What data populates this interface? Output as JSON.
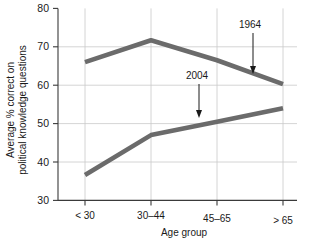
{
  "chart_data": {
    "type": "line",
    "title": "",
    "subtitle": "",
    "xlabel": "Age group",
    "ylabel": "Average % correct on political knowledge questions",
    "ylabel_line1": "Average % correct on",
    "ylabel_line2": "political knowledge questions",
    "categories": [
      "< 30",
      "30–44",
      "45–65",
      "> 65"
    ],
    "ylim": [
      30,
      80
    ],
    "yticks": [
      30,
      40,
      50,
      60,
      70,
      80
    ],
    "ytick_labels": [
      "30",
      "40",
      "50",
      "60",
      "70",
      "80"
    ],
    "grid": true,
    "grid_axis": "y",
    "legend": "none",
    "series": [
      {
        "name": "1964",
        "values": [
          66,
          71.7,
          66.5,
          60.3
        ],
        "color": "#6b6b6b"
      },
      {
        "name": "2004",
        "values": [
          36.6,
          47,
          50.5,
          54
        ],
        "color": "#6b6b6b"
      }
    ],
    "annotations": [
      {
        "label": "1964",
        "series": "1964",
        "target_category": "> 65",
        "label_x": 250,
        "label_y": 28,
        "arrow_from_y": 33,
        "arrow_to_x": 253,
        "arrow_to_y": 73
      },
      {
        "label": "2004",
        "series": "2004",
        "target_category": "45–65",
        "label_x": 197,
        "label_y": 79,
        "arrow_from_y": 84,
        "arrow_to_x": 199,
        "arrow_to_y": 117
      }
    ]
  }
}
